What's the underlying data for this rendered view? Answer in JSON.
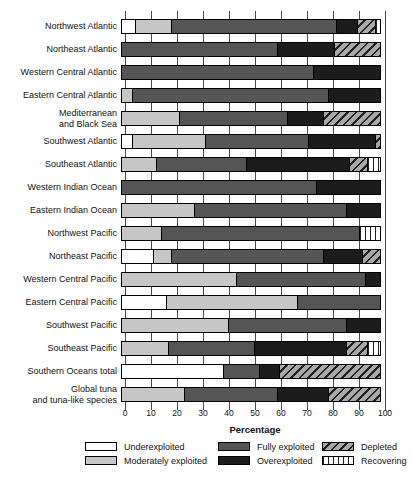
{
  "chart_data": {
    "type": "bar",
    "stacked": true,
    "orientation": "horizontal",
    "title": "",
    "xlabel": "Percentage",
    "ylabel": "",
    "xlim": [
      0,
      100
    ],
    "xticks": [
      0,
      10,
      20,
      30,
      40,
      50,
      60,
      70,
      80,
      90,
      100
    ],
    "grid": "vertical-gridlines-every-10",
    "legend_position": "bottom",
    "categories": [
      "Northwest Atlantic",
      "Northeast Atlantic",
      "Western Central Atlantic",
      "Eastern Central Atlantic",
      "Mediterranean and Black Sea",
      "Southwest Atlantic",
      "Southeast Atlantic",
      "Western Indian Ocean",
      "Eastern Indian Ocean",
      "Northwest Pacific",
      "Northeast Pacific",
      "Western Central Pacific",
      "Eastern Central Pacific",
      "Southwest Pacific",
      "Southeast Pacific",
      "Southern Oceans total",
      "Global tuna and tuna-like species"
    ],
    "category_display_lines": [
      [
        "Northwest Atlantic"
      ],
      [
        "Northeast Atlantic"
      ],
      [
        "Western Central Atlantic"
      ],
      [
        "Eastern Central Atlantic"
      ],
      [
        "Mediterranean",
        "and Black Sea"
      ],
      [
        "Southwest Atlantic"
      ],
      [
        "Southeast Atlantic"
      ],
      [
        "Western Indian Ocean"
      ],
      [
        "Eastern Indian Ocean"
      ],
      [
        "Northwest Pacific"
      ],
      [
        "Northeast Pacific"
      ],
      [
        "Western Central Pacific"
      ],
      [
        "Eastern Central Pacific"
      ],
      [
        "Southwest Pacific"
      ],
      [
        "Southeast Pacific"
      ],
      [
        "Southern Oceans total"
      ],
      [
        "Global tuna",
        "and tuna-like species"
      ]
    ],
    "series": [
      {
        "name": "Underexploited",
        "color": "#ffffff",
        "values": [
          5,
          0,
          0,
          0,
          0,
          4,
          0,
          0,
          0,
          0,
          12,
          0,
          17,
          0,
          0,
          39,
          0
        ]
      },
      {
        "name": "Moderately exploited",
        "color": "#c6c6c6",
        "values": [
          14,
          0,
          0,
          4,
          22,
          28,
          13,
          0,
          28,
          15,
          7,
          44,
          51,
          41,
          18,
          0,
          24
        ]
      },
      {
        "name": "Fully exploited",
        "color": "#555555",
        "values": [
          64,
          60,
          74,
          76,
          42,
          40,
          35,
          75,
          59,
          77,
          59,
          50,
          32,
          46,
          33,
          14,
          36
        ]
      },
      {
        "name": "Overexploited",
        "color": "#1c1c1c",
        "values": [
          8,
          22,
          26,
          20,
          14,
          26,
          40,
          25,
          13,
          0,
          15,
          6,
          0,
          13,
          36,
          8,
          20
        ]
      },
      {
        "name": "Depleted",
        "pattern": "diagonal-hatch",
        "bg": "#a8a8a8",
        "stripe": "#1f1f1f",
        "values": [
          7,
          18,
          0,
          0,
          22,
          2,
          7,
          0,
          0,
          0,
          7,
          0,
          0,
          0,
          8,
          39,
          20
        ]
      },
      {
        "name": "Recovering",
        "pattern": "vertical-stripes",
        "bg": "#ffffff",
        "stripe": "#1f1f1f",
        "values": [
          2,
          0,
          0,
          0,
          0,
          0,
          5,
          0,
          0,
          8,
          0,
          0,
          0,
          0,
          5,
          0,
          0
        ]
      }
    ]
  }
}
